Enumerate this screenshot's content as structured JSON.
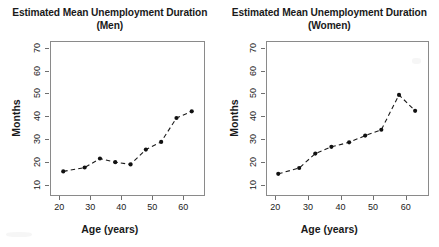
{
  "figure": {
    "background": "#ffffff",
    "line_color": "#1a1a1a",
    "marker_color": "#111111",
    "frame_color": "#8a8a8a"
  },
  "chart_data": [
    {
      "type": "line",
      "title": "Estimated Mean Unemployment Duration",
      "subtitle": "(Men)",
      "xlabel": "Age (years)",
      "ylabel": "Months",
      "xlim": [
        17,
        67
      ],
      "ylim": [
        5,
        73
      ],
      "xticks": [
        20,
        30,
        40,
        50,
        60
      ],
      "yticks": [
        10,
        20,
        30,
        40,
        50,
        60,
        70
      ],
      "xticklabels": [
        "20",
        "30",
        "40",
        "50",
        "60"
      ],
      "yticklabels": [
        "10",
        "20",
        "30",
        "40",
        "50",
        "60",
        "70"
      ],
      "grid": false,
      "legend": false,
      "linestyle": "dashed",
      "marker": "filled-circle",
      "x": [
        21,
        28,
        33,
        38,
        43,
        48,
        53,
        58,
        63
      ],
      "values": [
        15.5,
        17.2,
        21.2,
        19.6,
        18.6,
        25.2,
        28.6,
        39.2,
        42.2
      ]
    },
    {
      "type": "line",
      "title": "Estimated Mean Unemployment Duration",
      "subtitle": "(Women)",
      "xlabel": "Age (years)",
      "ylabel": "Months",
      "xlim": [
        17,
        67
      ],
      "ylim": [
        5,
        73
      ],
      "xticks": [
        20,
        30,
        40,
        50,
        60
      ],
      "yticks": [
        10,
        20,
        30,
        40,
        50,
        60,
        70
      ],
      "xticklabels": [
        "20",
        "30",
        "40",
        "50",
        "60"
      ],
      "yticklabels": [
        "10",
        "20",
        "30",
        "40",
        "50",
        "60",
        "70"
      ],
      "grid": false,
      "legend": false,
      "linestyle": "dashed",
      "marker": "filled-circle",
      "x": [
        20.5,
        27,
        32,
        37,
        42.5,
        47.5,
        52.5,
        58,
        63
      ],
      "values": [
        14.4,
        17.0,
        23.4,
        26.4,
        28.4,
        31.4,
        34.0,
        49.5,
        42.4
      ]
    }
  ]
}
